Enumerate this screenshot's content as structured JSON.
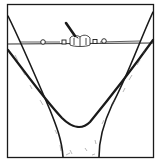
{
  "figure": {
    "colors": {
      "ink": "#1a1a1a",
      "background": "#ffffff",
      "bark_shade": "#555555"
    },
    "frame": {
      "x": 7,
      "y": 4,
      "width": 147,
      "height": 154
    },
    "cable": {
      "y_left": 43,
      "y_right": 43,
      "x_start": 8,
      "x_end": 153
    },
    "tensioner": {
      "cx": 80,
      "cy": 42,
      "handle_angle": "up-left"
    }
  }
}
